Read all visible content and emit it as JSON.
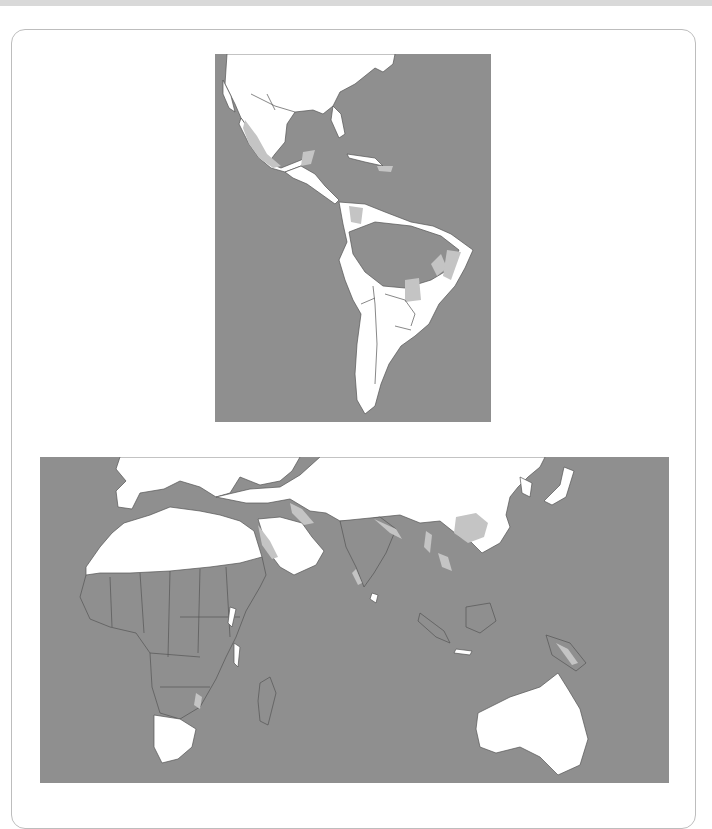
{
  "figure": {
    "type": "map",
    "panels": [
      {
        "id": "americas",
        "region": "Americas (North, Central and South America)"
      },
      {
        "id": "old-world",
        "region": "Europe, Africa, Asia and Australia"
      }
    ],
    "legend": {
      "ocean_and_highlighted_region": "#8f8f8f",
      "unhighlighted_land": "#ffffff",
      "secondary_shaded_region": "#c4c4c4",
      "borders": "#555555"
    },
    "colors": {
      "page_background": "#ffffff",
      "panel_border": "#bdbdbd",
      "top_strip": "#d9d9d9"
    }
  }
}
